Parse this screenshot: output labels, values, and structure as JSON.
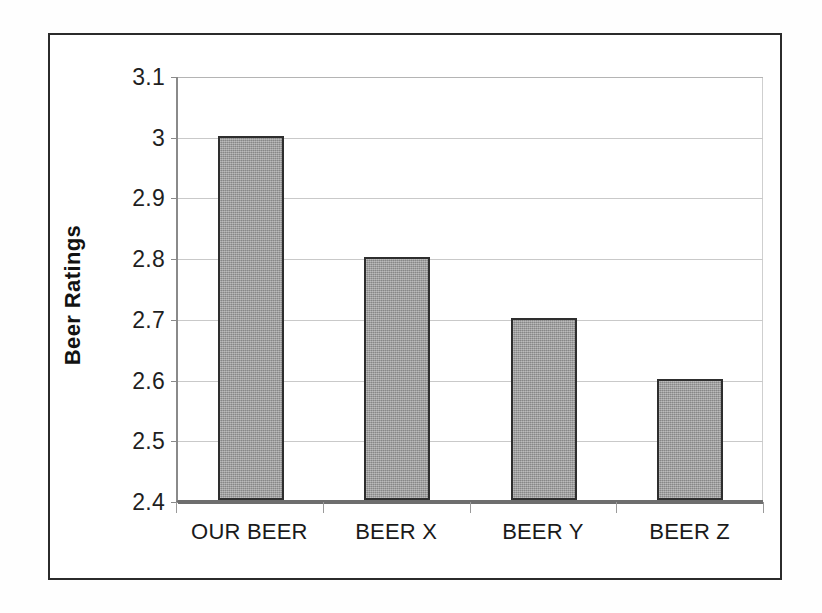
{
  "chart_data": {
    "type": "bar",
    "title": "",
    "subtitle": "",
    "xlabel": "",
    "ylabel": "Beer Ratings",
    "categories": [
      "OUR BEER",
      "BEER X",
      "BEER Y",
      "BEER Z"
    ],
    "values": [
      3.0,
      2.8,
      2.7,
      2.6
    ],
    "value_labels": [
      "3",
      "2.8",
      "2.7",
      "2.6"
    ],
    "ylim": [
      2.4,
      3.1
    ],
    "ytick_values": [
      3.1,
      3.0,
      2.9,
      2.8,
      2.7,
      2.6,
      2.5,
      2.4
    ],
    "ytick_labels": [
      "3.1",
      "3",
      "2.9",
      "2.8",
      "2.7",
      "2.6",
      "2.5",
      "2.4"
    ],
    "grid": true,
    "grid_axis": "y",
    "legend": false,
    "legend_position": "none",
    "series": [
      {
        "name": "Beer Ratings",
        "values": [
          3.0,
          2.8,
          2.7,
          2.6
        ]
      }
    ],
    "colors": {
      "bar_fill": "#9a9a9a",
      "bar_outline": "#2e2e2e",
      "gridline": "#c9c9c9",
      "axis": "#6e6e6e",
      "frame": "#2b2b2b",
      "text": "#1a1a1a",
      "background": "#ffffff"
    }
  }
}
